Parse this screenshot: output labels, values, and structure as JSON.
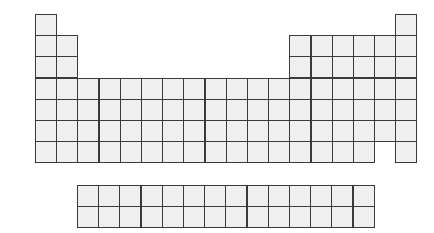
{
  "diagram": {
    "title": "",
    "type": "blank-periodic-table",
    "colors": {
      "cell_fill": "#efefef",
      "cell_border": "#3a3a3a",
      "background": "#ffffff"
    },
    "main_grid": {
      "origin": [
        35,
        14
      ],
      "cell_size": 21.2,
      "rows": [
        {
          "period": 1,
          "groups": [
            1,
            18
          ]
        },
        {
          "period": 2,
          "groups": [
            1,
            2,
            13,
            14,
            15,
            16,
            17,
            18
          ]
        },
        {
          "period": 3,
          "groups": [
            1,
            2,
            13,
            14,
            15,
            16,
            17,
            18
          ]
        },
        {
          "period": 4,
          "groups": [
            1,
            2,
            3,
            4,
            5,
            6,
            7,
            8,
            9,
            10,
            11,
            12,
            13,
            14,
            15,
            16,
            17,
            18
          ]
        },
        {
          "period": 5,
          "groups": [
            1,
            2,
            3,
            4,
            5,
            6,
            7,
            8,
            9,
            10,
            11,
            12,
            13,
            14,
            15,
            16,
            17,
            18
          ]
        },
        {
          "period": 6,
          "groups": [
            1,
            2,
            3,
            4,
            5,
            6,
            7,
            8,
            9,
            10,
            11,
            12,
            13,
            14,
            15,
            16,
            17,
            18
          ]
        },
        {
          "period": 7,
          "groups": [
            1,
            2,
            3,
            4,
            5,
            6,
            7,
            8,
            9,
            10,
            11,
            12,
            13,
            14,
            15,
            16,
            18
          ]
        }
      ]
    },
    "f_block": {
      "origin": [
        77,
        185
      ],
      "cell_size": 21.2,
      "rows": 2,
      "columns": 14
    }
  }
}
